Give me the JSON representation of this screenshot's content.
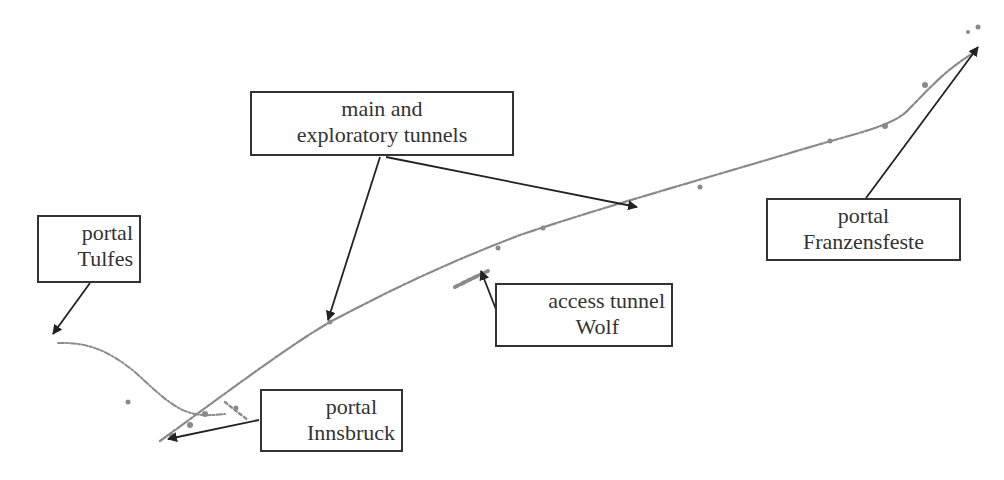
{
  "diagram": {
    "type": "tunnel-route-annotated-map",
    "colors": {
      "tunnel_line": "#8a8a8a",
      "arrow": "#222222",
      "box_border": "#333333",
      "text": "#333333",
      "background": "#ffffff"
    },
    "labels": {
      "main": {
        "line1": "main and",
        "line2": "exploratory tunnels"
      },
      "tulfes": {
        "line1": "portal",
        "line2": "Tulfes"
      },
      "innsbruck": {
        "line1": "portal",
        "line2": "Innsbruck"
      },
      "wolf": {
        "line1": "access tunnel",
        "line2": "Wolf"
      },
      "franzensfeste": {
        "line1": "portal",
        "line2": "Franzensfeste"
      }
    },
    "paths": {
      "main_tunnel": "M160,441 C230,390 290,345 330,322 C400,285 450,262 520,235 C600,208 700,180 800,150 C860,132 895,126 910,108 C930,88 945,70 975,52",
      "tulfes_branch": "M58,343 C90,342 110,352 135,372 C160,395 175,410 195,414 C205,416 215,415 225,414",
      "innsbruck_spur": "M225,402 C232,408 240,414 248,420",
      "wolf_access": "M455,287 C465,282 475,277 488,271"
    },
    "arrows": [
      {
        "name": "arrow-to-main-tunnel-left",
        "x1": 380,
        "y1": 157,
        "x2": 328,
        "y2": 320
      },
      {
        "name": "arrow-to-main-tunnel-right",
        "x1": 386,
        "y1": 157,
        "x2": 637,
        "y2": 207
      },
      {
        "name": "arrow-to-portal-tulfes",
        "x1": 90,
        "y1": 283,
        "x2": 53,
        "y2": 334
      },
      {
        "name": "arrow-to-portal-innsbruck",
        "x1": 259,
        "y1": 420,
        "x2": 168,
        "y2": 439
      },
      {
        "name": "arrow-to-access-tunnel-wolf",
        "x1": 497,
        "y1": 312,
        "x2": 481,
        "y2": 271
      },
      {
        "name": "arrow-to-portal-franzensfeste",
        "x1": 866,
        "y1": 198,
        "x2": 978,
        "y2": 47
      }
    ]
  }
}
